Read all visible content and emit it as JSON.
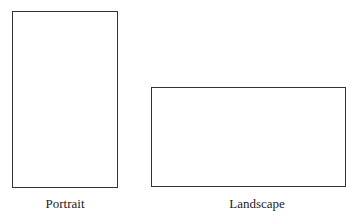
{
  "diagram": {
    "shapes": [
      {
        "id": "portrait",
        "label": "Portrait",
        "orientation": "portrait"
      },
      {
        "id": "landscape",
        "label": "Landscape",
        "orientation": "landscape"
      }
    ]
  }
}
